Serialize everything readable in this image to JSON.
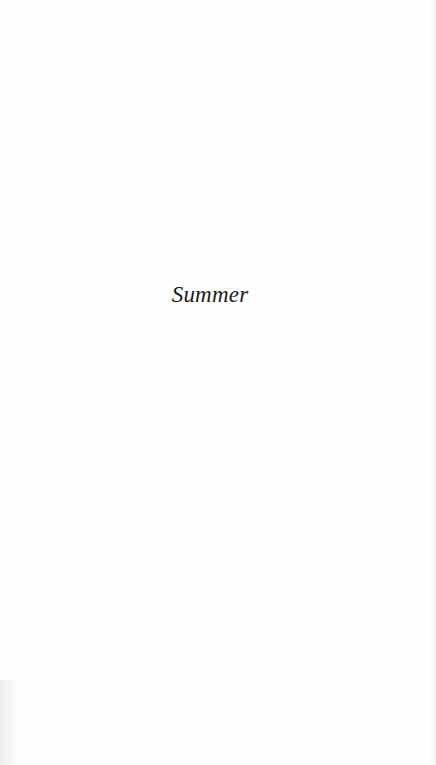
{
  "page": {
    "section_title": "Summer",
    "background_color": "#fefefe",
    "text_color": "#1a1a1a"
  }
}
